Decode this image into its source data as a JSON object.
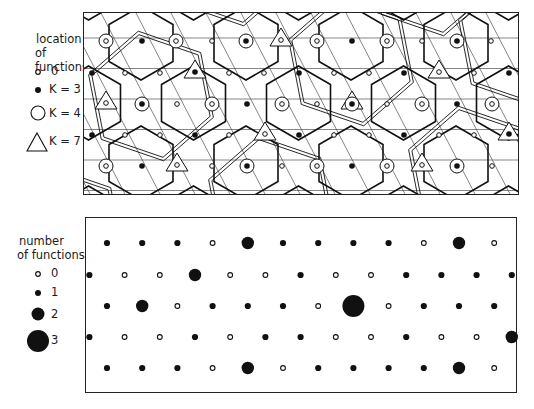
{
  "top_panel": {
    "legend": {
      "title_line1": "location",
      "title_line2": "of functions",
      "items": [
        {
          "symbol": "small-open-circle",
          "label": "0"
        },
        {
          "symbol": "filled-dot",
          "label": "K = 3"
        },
        {
          "symbol": "large-open-circle",
          "label": "K = 4"
        },
        {
          "symbol": "triangle",
          "label": "K = 7"
        }
      ]
    },
    "description": "Superimposed hexagonal market-area lattices (central place hierarchy) with K=3, K=4 and K=7 centers"
  },
  "bottom_panel": {
    "legend": {
      "title_line1": "number",
      "title_line2": "of functions",
      "items": [
        {
          "symbol": "open-circle",
          "label": "0"
        },
        {
          "symbol": "dot-small",
          "label": "1"
        },
        {
          "symbol": "dot-medium",
          "label": "2"
        },
        {
          "symbol": "dot-large",
          "label": "3"
        }
      ]
    },
    "rows": [
      {
        "y": 242,
        "offset": 0,
        "values": [
          1,
          1,
          1,
          0,
          2,
          1,
          1,
          1,
          1,
          0,
          2,
          0
        ]
      },
      {
        "y": 274,
        "offset": -1,
        "values": [
          1,
          0,
          0,
          2,
          0,
          0,
          1,
          0,
          0,
          1,
          1,
          1,
          1
        ]
      },
      {
        "y": 305,
        "offset": 0,
        "values": [
          1,
          2,
          0,
          1,
          1,
          1,
          0,
          3,
          0,
          1,
          1,
          1
        ]
      },
      {
        "y": 336,
        "offset": -1,
        "values": [
          1,
          0,
          0,
          1,
          0,
          1,
          1,
          0,
          0,
          1,
          0,
          0,
          2
        ]
      },
      {
        "y": 367,
        "offset": 0,
        "values": [
          1,
          1,
          1,
          0,
          2,
          0,
          1,
          1,
          1,
          1,
          2,
          0
        ]
      }
    ]
  }
}
